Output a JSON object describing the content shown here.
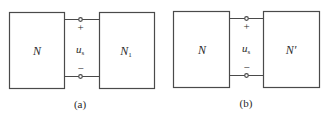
{
  "panels": [
    {
      "id": "a",
      "caption": "(a)",
      "left_network": {
        "label": "N"
      },
      "right_network": {
        "label": "N",
        "subscript": "1"
      },
      "port_voltage": {
        "symbol": "u",
        "subscript": "s"
      },
      "plus_sign": "+",
      "minus_sign": "−"
    },
    {
      "id": "b",
      "caption": "(b)",
      "left_network": {
        "label": "N"
      },
      "right_network": {
        "label": "N′"
      },
      "port_voltage": {
        "symbol": "u",
        "subscript": "s"
      },
      "plus_sign": "+",
      "minus_sign": "−"
    }
  ],
  "colors": {
    "line": "#4a4a4a",
    "text": "#2a2a2a",
    "background": "#ffffff"
  }
}
